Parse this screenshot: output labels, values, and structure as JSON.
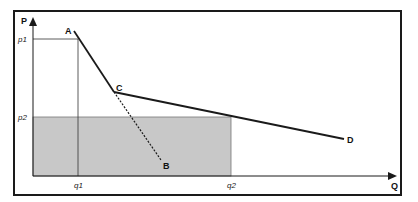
{
  "diagram": {
    "axes": {
      "y_label": "P",
      "x_label": "Q"
    },
    "ticks": {
      "p1": "p1",
      "p2": "p2",
      "q1": "q1",
      "q2": "q2"
    },
    "points": {
      "A": "A",
      "B": "B",
      "C": "C",
      "D": "D"
    },
    "colors": {
      "shade": "#c8c8c8",
      "line": "#1a1a1a",
      "frame": "#1a1a1a"
    }
  }
}
